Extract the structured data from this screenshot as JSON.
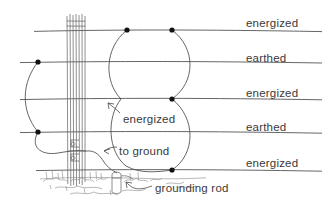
{
  "diagram": {
    "ink_color": "#3a3a3a",
    "line_color": "#555555",
    "conductors": [
      {
        "id": "c1",
        "label": "energized",
        "y": 30,
        "label_x": 246,
        "label_y": 18
      },
      {
        "id": "c2",
        "label": "earthed",
        "y": 62,
        "label_x": 246,
        "label_y": 53
      },
      {
        "id": "c3",
        "label": "energized",
        "y": 99,
        "label_x": 246,
        "label_y": 88
      },
      {
        "id": "c4",
        "label": "earthed",
        "y": 132,
        "label_x": 246,
        "label_y": 122
      },
      {
        "id": "c5",
        "label": "energized",
        "y": 170,
        "label_x": 246,
        "label_y": 158
      }
    ],
    "annotations": [
      {
        "id": "a1",
        "label": "energized",
        "x": 123,
        "y": 118
      },
      {
        "id": "a2",
        "label": "to ground",
        "x": 119,
        "y": 151
      },
      {
        "id": "a3",
        "label": "grounding rod",
        "x": 155,
        "y": 188
      }
    ],
    "junction_dots": [
      {
        "x": 38,
        "y": 62
      },
      {
        "x": 38,
        "y": 132
      },
      {
        "x": 127,
        "y": 30
      },
      {
        "x": 172,
        "y": 30
      },
      {
        "x": 172,
        "y": 99
      },
      {
        "x": 172,
        "y": 170
      }
    ],
    "pole": {
      "x": 70,
      "top": 14,
      "bottom": 186,
      "strand_count": 7
    },
    "grounding_rod": {
      "x": 117,
      "top": 172,
      "bottom": 192
    },
    "ground_line_y": 178
  }
}
